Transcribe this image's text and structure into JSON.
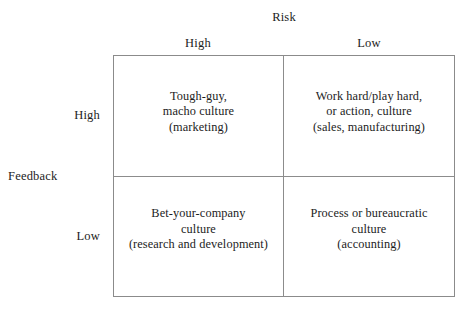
{
  "figure": {
    "column_axis": {
      "title": "Risk",
      "headers": [
        "High",
        "Low"
      ]
    },
    "row_axis": {
      "title": "Feedback",
      "headers": [
        "High",
        "Low"
      ]
    },
    "cells": [
      {
        "row": "High",
        "column": "High",
        "text": "Tough-guy,\nmacho culture\n(marketing)"
      },
      {
        "row": "High",
        "column": "Low",
        "text": "Work hard/play hard,\nor action, culture\n(sales, manufacturing)"
      },
      {
        "row": "Low",
        "column": "High",
        "text": "Bet-your-company\nculture\n(research and development)"
      },
      {
        "row": "Low",
        "column": "Low",
        "text": "Process or bureaucratic\nculture\n(accounting)"
      }
    ],
    "colors": {
      "background": "#ffffff",
      "line": "#8c8c8c",
      "text": "#1c1c1c"
    }
  }
}
